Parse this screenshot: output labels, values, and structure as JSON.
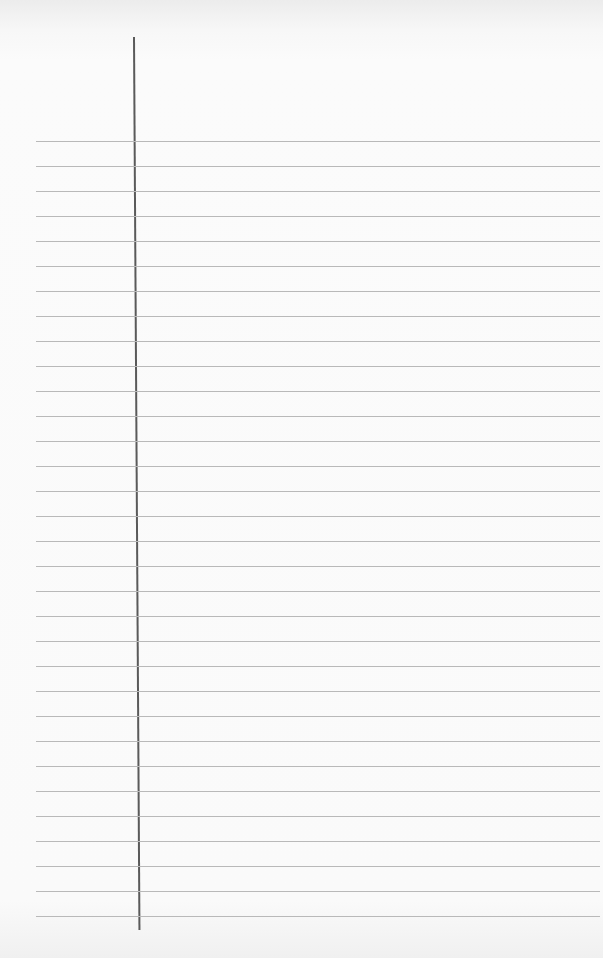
{
  "page": {
    "type": "lined-paper",
    "rule_color": "#b9b9b9",
    "margin_line_color": "#5a5a5a",
    "background_color": "#fafafa",
    "rule_count": 32,
    "rule_start_y": 141,
    "rule_spacing": 25
  }
}
